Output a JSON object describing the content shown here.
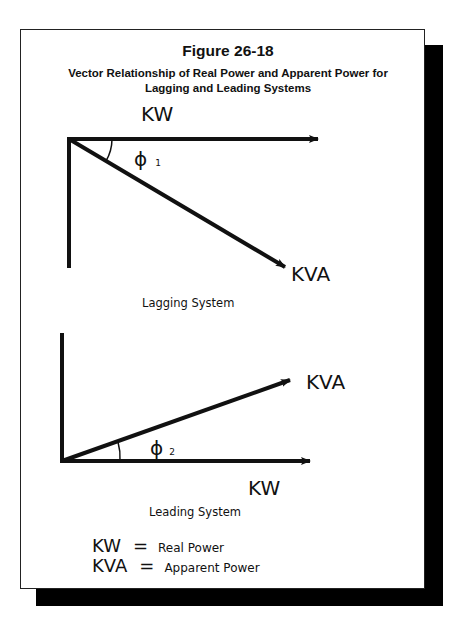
{
  "figure": {
    "number": "Figure 26-18",
    "subtitle_line1": "Vector Relationship of Real Power and Apparent Power for",
    "subtitle_line2": "Lagging and Leading Systems"
  },
  "lagging": {
    "kw_label": "KW",
    "kva_label": "KVA",
    "angle_symbol": "ϕ",
    "angle_subscript": "1",
    "caption": "Lagging System"
  },
  "leading": {
    "kw_label": "KW",
    "kva_label": "KVA",
    "angle_symbol": "ϕ",
    "angle_subscript": "2",
    "caption": "Leading System"
  },
  "legend": [
    {
      "symbol": "KW",
      "equals": "=",
      "meaning": "Real Power"
    },
    {
      "symbol": "KVA",
      "equals": "=",
      "meaning": "Apparent Power"
    }
  ],
  "colors": {
    "ink": "#111111",
    "background": "#ffffff",
    "shadow": "#000000"
  }
}
